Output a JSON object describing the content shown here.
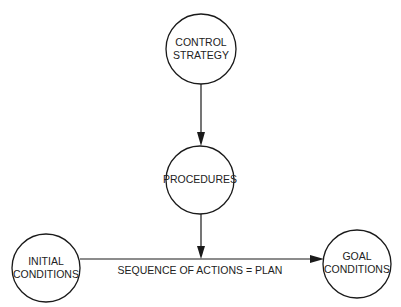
{
  "diagram": {
    "nodes": {
      "control_strategy": {
        "lines": [
          "CONTROL",
          "STRATEGY"
        ]
      },
      "procedures": {
        "lines": [
          "PROCEDURES"
        ]
      },
      "initial_conditions": {
        "lines": [
          "INITIAL",
          "CONDITIONS"
        ]
      },
      "goal_conditions": {
        "lines": [
          "GOAL",
          "CONDITIONS"
        ]
      }
    },
    "edges": {
      "control_to_procedures": {
        "from": "CONTROL STRATEGY",
        "to": "PROCEDURES"
      },
      "procedures_to_sequence": {
        "from": "PROCEDURES",
        "to": "SEQUENCE OF ACTIONS"
      },
      "initial_to_goal": {
        "from": "INITIAL CONDITIONS",
        "to": "GOAL CONDITIONS",
        "label": "SEQUENCE OF ACTIONS  =  PLAN"
      }
    },
    "colors": {
      "stroke": "#1a1a1a",
      "text": "#222222",
      "background": "#ffffff"
    }
  }
}
